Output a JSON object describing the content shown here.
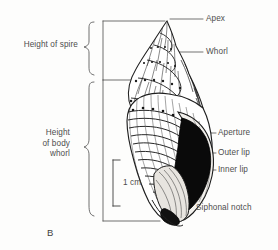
{
  "figure": {
    "panel_label": "B",
    "background_color": "#fdfdfc",
    "ink_color": "#2b2b2b",
    "label_color": "#4d4d4d"
  },
  "labels": {
    "apex": "Apex",
    "whorl": "Whorl",
    "aperture": "Aperture",
    "outer_lip": "Outer lip",
    "inner_lip": "Inner lip",
    "siphonal_notch": "Siphonal notch"
  },
  "measurements": {
    "height_of_spire": "Height of spire",
    "height_of_body_whorl_line1": "Height",
    "height_of_body_whorl_line2": "of body",
    "height_of_body_whorl_line3": "whorl",
    "scale_bar": "1 cm"
  }
}
